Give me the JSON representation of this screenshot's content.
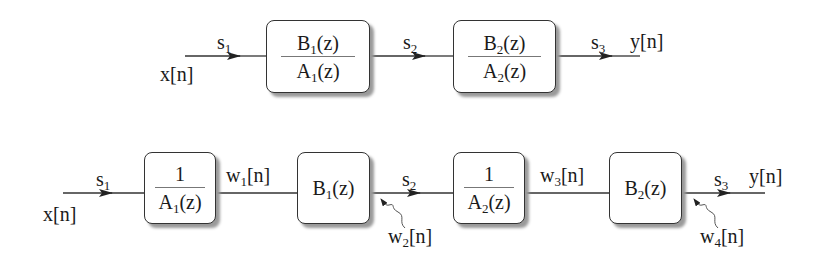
{
  "top_diagram": {
    "input_label": "x[n]",
    "output_label": "y[n]",
    "signals": [
      "s1",
      "s2",
      "s3"
    ],
    "blocks": [
      {
        "numerator": "B1(z)",
        "denominator": "A1(z)"
      },
      {
        "numerator": "B2(z)",
        "denominator": "A2(z)"
      }
    ]
  },
  "bottom_diagram": {
    "input_label": "x[n]",
    "output_label": "y[n]",
    "signals": [
      "s1",
      "s2",
      "s3"
    ],
    "internal_signals": [
      "w1[n]",
      "w3[n]"
    ],
    "noise_inputs": [
      "w2[n]",
      "w4[n]"
    ],
    "blocks": [
      {
        "numerator": "1",
        "denominator": "A1(z)"
      },
      {
        "label": "B1(z)"
      },
      {
        "numerator": "1",
        "denominator": "A2(z)"
      },
      {
        "label": "B2(z)"
      }
    ]
  },
  "colors": {
    "line": "#333333",
    "shadow": "#9a9a9a"
  }
}
